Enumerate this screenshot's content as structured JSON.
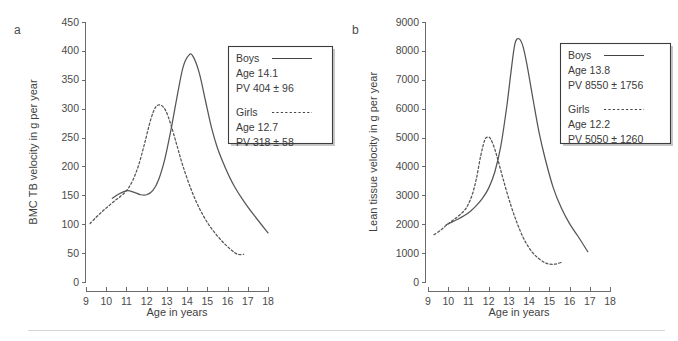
{
  "figure": {
    "background": "#ffffff",
    "curve_color": "#555555",
    "axis_color": "#6b6b6b",
    "text_color": "#3a3a3a",
    "footer_rule_color": "#d6d6d6"
  },
  "panels": [
    {
      "label": "a",
      "ylabel": "BMC TB velocity in g per year",
      "xlabel": "Age in years",
      "legend": {
        "boys": {
          "name": "Boys",
          "age": "Age 14.1",
          "pv": "PV 404 ± 96"
        },
        "girls": {
          "name": "Girls",
          "age": "Age 12.7",
          "pv": "PV 318 ± 58"
        }
      }
    },
    {
      "label": "b",
      "ylabel": "Lean tissue velocity in g per year",
      "xlabel": "Age in years",
      "legend": {
        "boys": {
          "name": "Boys",
          "age": "Age 13.8",
          "pv": "PV 8550 ± 1756"
        },
        "girls": {
          "name": "Girls",
          "age": "Age 12.2",
          "pv": "PV 5050 ± 1260"
        }
      }
    }
  ],
  "chart_data": [
    {
      "type": "line",
      "panel": "a",
      "title": "",
      "xlabel": "Age in years",
      "ylabel": "BMC TB velocity in g per year",
      "xlim": [
        9,
        18
      ],
      "ylim": [
        0,
        450
      ],
      "xticks": [
        9,
        10,
        11,
        12,
        13,
        14,
        15,
        16,
        17,
        18
      ],
      "yticks": [
        0,
        50,
        100,
        150,
        200,
        250,
        300,
        350,
        400,
        450
      ],
      "xtick_labels": [
        "9",
        "10",
        "11",
        "12",
        "13",
        "14",
        "15",
        "16",
        "17",
        "18"
      ],
      "ytick_labels": [
        "0",
        "50",
        "100",
        "150",
        "200",
        "250",
        "300",
        "350",
        "400",
        "450"
      ],
      "grid": false,
      "legend_position": "upper-right",
      "series": [
        {
          "name": "Boys",
          "style": "solid",
          "peak_age": 14.1,
          "peak_value": 404,
          "peak_sd": 96,
          "annotation": "Age 14.1 / PV 404 ± 96",
          "x": [
            10.3,
            10.6,
            10.9,
            11.1,
            11.4,
            11.7,
            12.0,
            12.3,
            12.6,
            12.9,
            13.2,
            13.5,
            13.8,
            14.1,
            14.3,
            14.6,
            14.9,
            15.2,
            15.5,
            15.9,
            16.3,
            16.8,
            17.3,
            18.0
          ],
          "y": [
            145,
            152,
            157,
            158,
            155,
            151,
            151,
            158,
            178,
            213,
            263,
            320,
            372,
            393,
            390,
            362,
            315,
            268,
            232,
            197,
            168,
            140,
            116,
            85
          ]
        },
        {
          "name": "Girls",
          "style": "dashed",
          "peak_age": 12.7,
          "peak_value": 318,
          "peak_sd": 58,
          "annotation": "Age 12.7 / PV 318 ± 58",
          "x": [
            9.2,
            9.5,
            9.8,
            10.1,
            10.4,
            10.7,
            11.0,
            11.3,
            11.6,
            11.9,
            12.2,
            12.45,
            12.7,
            12.95,
            13.2,
            13.5,
            13.8,
            14.2,
            14.6,
            15.0,
            15.4,
            15.8,
            16.2,
            16.5,
            16.8
          ],
          "y": [
            101,
            112,
            122,
            131,
            140,
            148,
            158,
            175,
            202,
            240,
            281,
            303,
            306,
            296,
            272,
            236,
            200,
            160,
            128,
            103,
            84,
            68,
            55,
            48,
            48
          ]
        }
      ]
    },
    {
      "type": "line",
      "panel": "b",
      "title": "",
      "xlabel": "Age in years",
      "ylabel": "Lean tissue velocity in g per year",
      "xlim": [
        9,
        18
      ],
      "ylim": [
        0,
        9000
      ],
      "xticks": [
        9,
        10,
        11,
        12,
        13,
        14,
        15,
        16,
        17,
        18
      ],
      "yticks": [
        0,
        1000,
        2000,
        3000,
        4000,
        5000,
        6000,
        7000,
        8000,
        9000
      ],
      "xtick_labels": [
        "9",
        "10",
        "11",
        "12",
        "13",
        "14",
        "15",
        "16",
        "17",
        "18"
      ],
      "ytick_labels": [
        "0",
        "1000",
        "2000",
        "3000",
        "4000",
        "5000",
        "6000",
        "7000",
        "8000",
        "9000"
      ],
      "grid": false,
      "legend_position": "upper-right",
      "series": [
        {
          "name": "Boys",
          "style": "solid",
          "peak_age": 13.8,
          "peak_value": 8550,
          "peak_sd": 1756,
          "annotation": "Age 13.8 / PV 8550 ± 1756",
          "x": [
            9.9,
            10.2,
            10.5,
            10.8,
            11.1,
            11.4,
            11.7,
            12.0,
            12.3,
            12.6,
            12.9,
            13.1,
            13.3,
            13.5,
            13.7,
            13.9,
            14.2,
            14.5,
            14.8,
            15.2,
            15.6,
            16.0,
            16.4,
            16.9
          ],
          "y": [
            1980,
            2080,
            2180,
            2300,
            2450,
            2650,
            2900,
            3250,
            3800,
            4700,
            6100,
            7250,
            8250,
            8420,
            8150,
            7500,
            6300,
            5150,
            4250,
            3250,
            2550,
            2020,
            1600,
            1050
          ]
        },
        {
          "name": "Girls",
          "style": "dashed",
          "peak_age": 12.2,
          "peak_value": 5050,
          "peak_sd": 1260,
          "annotation": "Age 12.2 / PV 5050 ± 1260",
          "x": [
            9.3,
            9.6,
            9.9,
            10.2,
            10.5,
            10.8,
            11.0,
            11.2,
            11.4,
            11.6,
            11.8,
            11.95,
            12.1,
            12.3,
            12.5,
            12.8,
            13.1,
            13.4,
            13.7,
            14.0,
            14.3,
            14.7,
            15.0,
            15.3,
            15.6
          ],
          "y": [
            1640,
            1780,
            1960,
            2120,
            2280,
            2480,
            2700,
            3050,
            3600,
            4350,
            4900,
            5020,
            4950,
            4600,
            4120,
            3350,
            2650,
            2050,
            1550,
            1180,
            920,
            700,
            620,
            620,
            680
          ]
        }
      ]
    }
  ]
}
